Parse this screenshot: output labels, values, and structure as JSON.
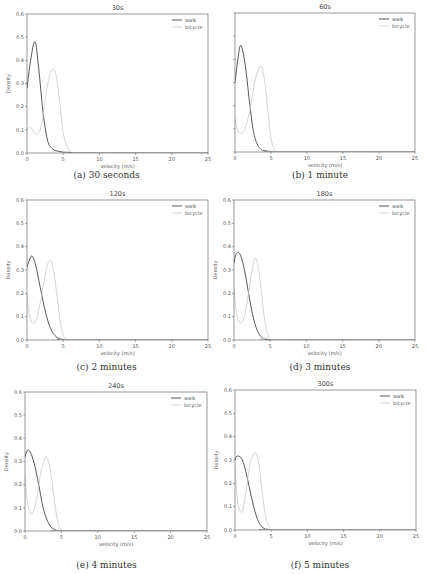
{
  "figure": {
    "panels": [
      {
        "id": "a",
        "title": "30s",
        "caption": "(a) 30 seconds",
        "show_ytick_labels": true
      },
      {
        "id": "b",
        "title": "60s",
        "caption": "(b) 1 minute",
        "show_ytick_labels": false
      },
      {
        "id": "c",
        "title": "120s",
        "caption": "(c) 2 minutes",
        "show_ytick_labels": true
      },
      {
        "id": "d",
        "title": "180s",
        "caption": "(d) 3 minutes",
        "show_ytick_labels": true
      },
      {
        "id": "e",
        "title": "240s",
        "caption": "(e) 4 minutes",
        "show_ytick_labels": true
      },
      {
        "id": "f",
        "title": "300s",
        "caption": "(f) 5 minutes",
        "show_ytick_labels": true
      }
    ],
    "colors": {
      "walk": "#444444",
      "bicycle": "#c8c8c8",
      "axis": "#555555",
      "text": "#555555"
    }
  },
  "chart_data": [
    {
      "type": "line",
      "title": "30s",
      "xlabel": "velocity (m/s)",
      "ylabel": "Density",
      "xlim": [
        0,
        25
      ],
      "ylim": [
        0,
        0.6
      ],
      "xticks": [
        0,
        5,
        10,
        15,
        20,
        25
      ],
      "yticks": [
        0.0,
        0.1,
        0.2,
        0.3,
        0.4,
        0.5,
        0.6
      ],
      "legend": [
        "walk",
        "bicycle"
      ],
      "legend_position": "upper right",
      "grid": false,
      "series": [
        {
          "name": "walk",
          "x": [
            0,
            0.5,
            1.1,
            1.6,
            2.2,
            2.8,
            3.3,
            4,
            5,
            6,
            8,
            25
          ],
          "values": [
            0.28,
            0.4,
            0.48,
            0.37,
            0.18,
            0.06,
            0.025,
            0.01,
            0.004,
            0.002,
            0.0,
            0.0
          ]
        },
        {
          "name": "bicycle",
          "x": [
            0,
            0.5,
            1.3,
            2,
            2.6,
            3.1,
            3.5,
            4,
            4.5,
            5,
            5.5,
            6,
            7,
            25
          ],
          "values": [
            0.1,
            0.11,
            0.08,
            0.12,
            0.25,
            0.33,
            0.36,
            0.34,
            0.22,
            0.09,
            0.03,
            0.01,
            0.0,
            0.0
          ]
        }
      ]
    },
    {
      "type": "line",
      "title": "60s",
      "xlabel": "velocity (m/s)",
      "ylabel": "",
      "xlim": [
        0,
        25
      ],
      "ylim": [
        0,
        0.6
      ],
      "xticks": [
        0,
        5,
        10,
        15,
        20,
        25
      ],
      "yticks": [],
      "legend": [
        "walk",
        "bicycle"
      ],
      "legend_position": "upper right",
      "grid": false,
      "series": [
        {
          "name": "walk",
          "x": [
            0,
            0.4,
            0.8,
            1.4,
            2,
            2.5,
            3,
            3.5,
            4,
            5,
            6,
            25
          ],
          "values": [
            0.3,
            0.4,
            0.46,
            0.38,
            0.22,
            0.1,
            0.04,
            0.015,
            0.006,
            0.002,
            0.0,
            0.0
          ]
        },
        {
          "name": "bicycle",
          "x": [
            0,
            0.3,
            0.8,
            1.5,
            2.2,
            2.8,
            3.5,
            4,
            4.5,
            5,
            5.5,
            6,
            25
          ],
          "values": [
            0.15,
            0.1,
            0.08,
            0.11,
            0.2,
            0.31,
            0.37,
            0.33,
            0.2,
            0.06,
            0.01,
            0.0,
            0.0
          ]
        }
      ]
    },
    {
      "type": "line",
      "title": "120s",
      "xlabel": "velocity (m/s)",
      "ylabel": "Density",
      "xlim": [
        0,
        25
      ],
      "ylim": [
        0,
        0.6
      ],
      "xticks": [
        0,
        5,
        10,
        15,
        20,
        25
      ],
      "yticks": [
        0.0,
        0.1,
        0.2,
        0.3,
        0.4,
        0.5,
        0.6
      ],
      "legend": [
        "walk",
        "bicycle"
      ],
      "legend_position": "upper right",
      "grid": false,
      "series": [
        {
          "name": "walk",
          "x": [
            0,
            0.3,
            0.7,
            1.2,
            1.8,
            2.4,
            3,
            3.5,
            4,
            4.5,
            5,
            6,
            25
          ],
          "values": [
            0.31,
            0.34,
            0.36,
            0.32,
            0.23,
            0.14,
            0.07,
            0.035,
            0.015,
            0.006,
            0.002,
            0.0,
            0.0
          ]
        },
        {
          "name": "bicycle",
          "x": [
            0,
            0.3,
            0.8,
            1.3,
            1.9,
            2.5,
            3.1,
            3.6,
            4.1,
            4.6,
            5,
            5.5,
            6,
            25
          ],
          "values": [
            0.2,
            0.11,
            0.07,
            0.09,
            0.17,
            0.28,
            0.34,
            0.31,
            0.2,
            0.08,
            0.02,
            0.005,
            0.0,
            0.0
          ]
        }
      ]
    },
    {
      "type": "line",
      "title": "180s",
      "xlabel": "velocity (m/s)",
      "ylabel": "Density",
      "xlim": [
        0,
        25
      ],
      "ylim": [
        0,
        0.6
      ],
      "xticks": [
        0,
        5,
        10,
        15,
        20,
        25
      ],
      "yticks": [
        0.0,
        0.1,
        0.2,
        0.3,
        0.4,
        0.5,
        0.6
      ],
      "legend": [
        "walk",
        "bicycle"
      ],
      "legend_position": "upper right",
      "grid": false,
      "series": [
        {
          "name": "walk",
          "x": [
            0,
            0.3,
            0.8,
            1.3,
            1.8,
            2.3,
            2.8,
            3.3,
            3.8,
            4.3,
            5,
            6,
            25
          ],
          "values": [
            0.33,
            0.37,
            0.37,
            0.32,
            0.24,
            0.15,
            0.08,
            0.035,
            0.012,
            0.004,
            0.001,
            0.0,
            0.0
          ]
        },
        {
          "name": "bicycle",
          "x": [
            0,
            0.2,
            0.5,
            1,
            1.5,
            2,
            2.5,
            2.9,
            3.3,
            3.8,
            4.3,
            4.8,
            5.3,
            25
          ],
          "values": [
            0.22,
            0.15,
            0.09,
            0.075,
            0.11,
            0.2,
            0.3,
            0.35,
            0.32,
            0.2,
            0.07,
            0.015,
            0.0,
            0.0
          ]
        }
      ]
    },
    {
      "type": "line",
      "title": "240s",
      "xlabel": "velocity (m/s)",
      "ylabel": "Density",
      "xlim": [
        0,
        25
      ],
      "ylim": [
        0,
        0.6
      ],
      "xticks": [
        0,
        5,
        10,
        15,
        20,
        25
      ],
      "yticks": [
        0.0,
        0.1,
        0.2,
        0.3,
        0.4,
        0.5,
        0.6
      ],
      "legend": [
        "walk",
        "bicycle"
      ],
      "legend_position": "upper right",
      "grid": false,
      "series": [
        {
          "name": "walk",
          "x": [
            0,
            0.2,
            0.5,
            1,
            1.5,
            2,
            2.5,
            3,
            3.5,
            4,
            4.5,
            5.5,
            25
          ],
          "values": [
            0.32,
            0.34,
            0.35,
            0.32,
            0.26,
            0.18,
            0.1,
            0.05,
            0.02,
            0.008,
            0.002,
            0.0,
            0.0
          ]
        },
        {
          "name": "bicycle",
          "x": [
            0,
            0.3,
            0.7,
            1.1,
            1.6,
            2.1,
            2.6,
            3,
            3.5,
            4,
            4.5,
            5,
            5.5,
            25
          ],
          "values": [
            0.25,
            0.13,
            0.08,
            0.08,
            0.14,
            0.24,
            0.3,
            0.32,
            0.26,
            0.14,
            0.04,
            0.008,
            0.0,
            0.0
          ]
        }
      ]
    },
    {
      "type": "line",
      "title": "300s",
      "xlabel": "velocity (m/s)",
      "ylabel": "Density",
      "xlim": [
        0,
        25
      ],
      "ylim": [
        0,
        0.6
      ],
      "xticks": [
        0,
        5,
        10,
        15,
        20,
        25
      ],
      "yticks": [
        0.0,
        0.1,
        0.2,
        0.3,
        0.4,
        0.5,
        0.6
      ],
      "legend": [
        "walk",
        "bicycle"
      ],
      "legend_position": "upper right",
      "grid": false,
      "series": [
        {
          "name": "walk",
          "x": [
            0,
            0.2,
            0.6,
            1,
            1.5,
            2,
            2.5,
            3,
            3.5,
            4,
            4.5,
            5.2,
            25
          ],
          "values": [
            0.3,
            0.315,
            0.315,
            0.3,
            0.25,
            0.18,
            0.11,
            0.055,
            0.022,
            0.007,
            0.002,
            0.0,
            0.0
          ]
        },
        {
          "name": "bicycle",
          "x": [
            0,
            0.3,
            0.7,
            1.1,
            1.5,
            2,
            2.5,
            2.9,
            3.3,
            3.8,
            4.3,
            4.8,
            5.3,
            25
          ],
          "values": [
            0.27,
            0.14,
            0.08,
            0.09,
            0.16,
            0.27,
            0.32,
            0.33,
            0.28,
            0.15,
            0.05,
            0.01,
            0.0,
            0.0
          ]
        }
      ]
    }
  ]
}
